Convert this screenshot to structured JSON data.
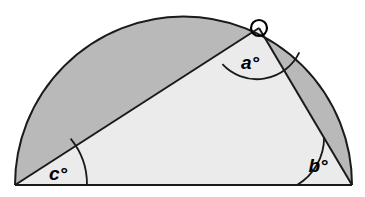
{
  "figure": {
    "kind": "geometry-diagram",
    "canvas": {
      "width": 365,
      "height": 197
    },
    "colors": {
      "background": "#ffffff",
      "segment_fill": "#b9b9b9",
      "triangle_fill": "#ebebeb",
      "stroke": "#1a1a1a",
      "label": "#000000"
    },
    "semicircle": {
      "center_x": 183.5,
      "center_y": 185,
      "radius": 168.5,
      "diameter_left_x": 15,
      "diameter_right_x": 352,
      "baseline_y": 185
    },
    "apex": {
      "x": 259,
      "y": 28,
      "marker": "open-circle",
      "marker_radius": 8
    },
    "labels": {
      "apex_angle": "a°",
      "right_base_angle": "b°",
      "left_base_angle": "c°"
    },
    "angle_arcs": {
      "apex_arc_radius": 47,
      "right_arc_radius": 55,
      "left_arc_radius": 72
    },
    "label_positions": {
      "apex": {
        "x": 250,
        "y": 69
      },
      "right": {
        "x": 318,
        "y": 172
      },
      "left": {
        "x": 58,
        "y": 180
      }
    }
  }
}
